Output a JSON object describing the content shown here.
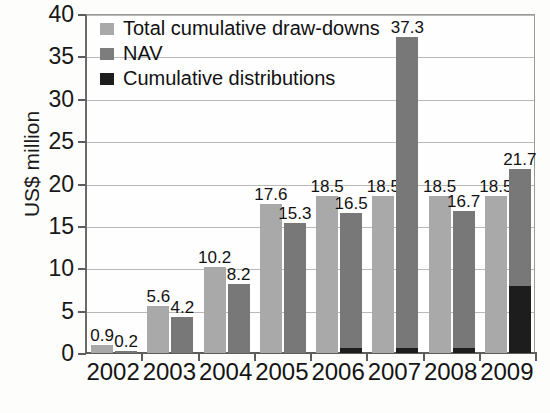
{
  "chart_data": {
    "type": "bar",
    "title": "",
    "xlabel": "",
    "ylabel": "US$ million",
    "ylim": [
      0,
      40
    ],
    "ytick_step": 5,
    "yticks": [
      "0",
      "5",
      "10",
      "15",
      "20",
      "25",
      "30",
      "35",
      "40"
    ],
    "grid": true,
    "legend_position": "top-left",
    "categories": [
      "2002",
      "2003",
      "2004",
      "2005",
      "2006",
      "2007",
      "2008",
      "2009"
    ],
    "series": [
      {
        "name": "Total cumulative draw-downs",
        "color": "#a9a9a9",
        "values": [
          0.9,
          5.6,
          10.2,
          17.6,
          18.5,
          18.5,
          18.5,
          18.5
        ],
        "labels": [
          "0.9",
          "5.6",
          "10.2",
          "17.6",
          "18.5",
          "18.5",
          "18.5",
          "18.5"
        ]
      },
      {
        "name": "NAV",
        "color": "#787878",
        "values": [
          0.2,
          4.2,
          8.2,
          15.3,
          16.5,
          37.3,
          16.7,
          21.7
        ],
        "labels": [
          "0.2",
          "4.2",
          "8.2",
          "15.3",
          "16.5",
          "37.3",
          "16.7",
          "21.7"
        ]
      },
      {
        "name": "Cumulative distributions",
        "color": "#1d1d1d",
        "values": [
          0,
          0,
          0,
          0,
          0.6,
          0.6,
          0.6,
          7.9
        ],
        "labels": [
          "",
          "",
          "",
          "",
          "",
          "",
          "",
          ""
        ]
      }
    ]
  },
  "legend": {
    "items": [
      {
        "label": "Total cumulative draw-downs",
        "swatch": "legend-swatch-draw-downs"
      },
      {
        "label": "NAV",
        "swatch": "legend-swatch-nav"
      },
      {
        "label": "Cumulative distributions",
        "swatch": "legend-swatch-distributions"
      }
    ]
  },
  "axis": {
    "y_title": "US$ million"
  }
}
